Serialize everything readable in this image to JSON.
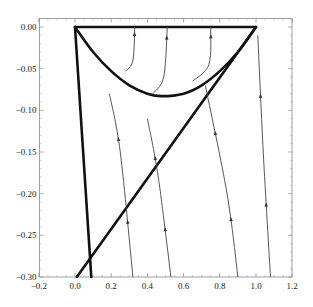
{
  "chart_data": {
    "type": "line",
    "title": "",
    "xlabel": "",
    "ylabel": "",
    "xlim": [
      -0.2,
      1.2
    ],
    "ylim": [
      -0.3,
      0.0
    ],
    "grid": false,
    "legend": null,
    "x_ticks": [
      "-0.2",
      "0.0",
      "0.2",
      "0.4",
      "0.6",
      "0.8",
      "1.0",
      "1.2"
    ],
    "y_ticks": [
      "0.00",
      "-0.05",
      "-0.10",
      "-0.15",
      "-0.20",
      "-0.25",
      "-0.30"
    ],
    "series": [
      {
        "name": "top-boundary",
        "style": "thick",
        "points": [
          [
            0,
            0
          ],
          [
            1,
            0
          ]
        ]
      },
      {
        "name": "parabola-boundary",
        "style": "thick",
        "points": [
          [
            0,
            0
          ],
          [
            0.1,
            -0.03
          ],
          [
            0.2,
            -0.053
          ],
          [
            0.3,
            -0.07
          ],
          [
            0.4,
            -0.08
          ],
          [
            0.48,
            -0.083
          ],
          [
            0.6,
            -0.08
          ],
          [
            0.7,
            -0.07
          ],
          [
            0.8,
            -0.053
          ],
          [
            0.9,
            -0.03
          ],
          [
            1.0,
            0
          ]
        ]
      },
      {
        "name": "diagonal-boundary",
        "style": "thick",
        "points": [
          [
            1.0,
            0
          ],
          [
            0.01,
            -0.3
          ]
        ]
      },
      {
        "name": "steep-boundary",
        "style": "thick",
        "points": [
          [
            0,
            0
          ],
          [
            0.09,
            -0.3
          ]
        ]
      },
      {
        "name": "trajectory-1a",
        "style": "thin-arrow",
        "points": [
          [
            0.32,
            -0.3
          ],
          [
            0.25,
            -0.15
          ],
          [
            0.19,
            -0.08
          ]
        ]
      },
      {
        "name": "trajectory-1b",
        "style": "thin-arrow",
        "points": [
          [
            0.28,
            -0.053
          ],
          [
            0.32,
            -0.04
          ],
          [
            0.33,
            0
          ]
        ]
      },
      {
        "name": "trajectory-2a",
        "style": "thin-arrow",
        "points": [
          [
            0.53,
            -0.3
          ],
          [
            0.46,
            -0.18
          ],
          [
            0.4,
            -0.11
          ]
        ]
      },
      {
        "name": "trajectory-2b",
        "style": "thin-arrow",
        "points": [
          [
            0.43,
            -0.08
          ],
          [
            0.49,
            -0.06
          ],
          [
            0.51,
            0
          ]
        ]
      },
      {
        "name": "trajectory-3a",
        "style": "thin-arrow",
        "points": [
          [
            0.9,
            -0.3
          ],
          [
            0.84,
            -0.2
          ],
          [
            0.72,
            -0.07
          ]
        ]
      },
      {
        "name": "trajectory-3b",
        "style": "thin-arrow",
        "points": [
          [
            0.65,
            -0.065
          ],
          [
            0.74,
            -0.045
          ],
          [
            0.75,
            0
          ]
        ]
      },
      {
        "name": "trajectory-4",
        "style": "thin-arrow",
        "points": [
          [
            1.08,
            -0.3
          ],
          [
            1.04,
            -0.15
          ],
          [
            1.01,
            -0.01
          ]
        ]
      }
    ]
  }
}
